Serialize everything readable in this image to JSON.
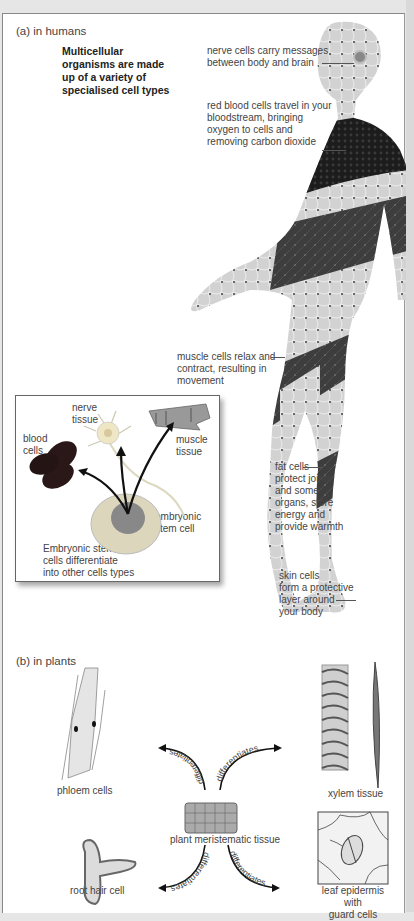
{
  "section_a": {
    "label": "(a) in humans",
    "intro": [
      "Multicellular",
      "organisms are made",
      "up of a variety of",
      "specialised cell types"
    ],
    "callouts": {
      "nerve": [
        "nerve cells carry messages",
        "between body and brain"
      ],
      "blood": [
        "red blood cells travel in your",
        "bloodstream, bringing",
        "oxygen to cells and",
        "removing carbon dioxide"
      ],
      "muscle": [
        "muscle cells relax and",
        "contract, resulting in",
        "movement"
      ],
      "fat": [
        "fat cells",
        "protect joints",
        "and some",
        "organs, store",
        "energy and",
        "provide warmth"
      ],
      "skin": [
        "skin cells",
        "form a protective",
        "layer around",
        "your body"
      ]
    },
    "inset": {
      "nerve_tissue": [
        "nerve",
        "tissue"
      ],
      "blood_cells": [
        "blood",
        "cells"
      ],
      "muscle_tissue": [
        "muscle",
        "tissue"
      ],
      "stem_cell": [
        "embryonic",
        "stem cell"
      ],
      "caption": [
        "Embryonic stem",
        "cells differentiate",
        "into other cells types"
      ]
    }
  },
  "section_b": {
    "label": "(b) in plants",
    "phloem": "phloem cells",
    "xylem": "xylem tissue",
    "meristem": "plant meristematic tissue",
    "root_hair": "root hair cell",
    "leaf": [
      "leaf epidermis with",
      "guard cells"
    ],
    "arrow_label": "differentiates"
  },
  "colors": {
    "dark_tissue": "#3a3a3a",
    "blood_tissue": "#1e1e1e",
    "light_tissue": "#cfcfcf",
    "frame_border": "#888888"
  }
}
